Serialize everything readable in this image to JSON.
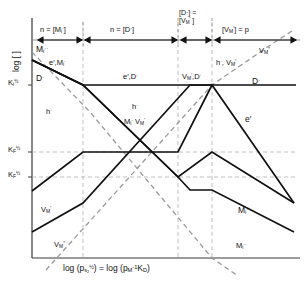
{
  "figure": {
    "kind": "brouwer-defect-diagram",
    "colors": {
      "line": "#111111",
      "dashed": "#9a9a9a",
      "axis": "#3a3a3a",
      "background": "#ffffff"
    }
  },
  "axes": {
    "y_label": "log [ ]",
    "x_label_html": "log (p<sub>s<sub>2</sub></sub><sup>&frac12;</sup>) = log (p<sub>M</sub><sup>-1</sup>K<sub>D</sub>)",
    "y_ticks": [
      {
        "id": "Ki",
        "html": "K<sub>i</sub><sup>&frac12;</sup>",
        "y_frac": 0.29
      },
      {
        "id": "KFp",
        "html": "K<sub>F</sub><sup>&frac12;</sup>",
        "y_frac": 0.545
      },
      {
        "id": "KF",
        "html": "K<sub>F</sub><sup>&frac12;</sup>",
        "y_frac": 0.655
      }
    ]
  },
  "regimes": [
    {
      "id": "regime-1",
      "html": "n = [M<sub>i</sub><sup>&middot;</sup>]",
      "x0": 38,
      "x1": 83
    },
    {
      "id": "regime-2",
      "html": "n = [D<sup>&middot;</sup>]",
      "x0": 85,
      "x1": 178
    },
    {
      "id": "regime-3",
      "html": "[D&middot;] =<br>[V<sub>M</sub><sup>&prime;</sup> ]",
      "x0": 180,
      "x1": 212
    },
    {
      "id": "regime-4",
      "html": "[V<sub>M</sub><sup>&prime;</sup>] = p",
      "x0": 214,
      "x1": 296
    }
  ],
  "curve_labels": [
    {
      "id": "Mi-dd-topleft",
      "html": "M<sub>i</sub><sup>&middot;&middot;</sup>",
      "x": 36,
      "y": 50
    },
    {
      "id": "e-Mi-upperleft",
      "html": "e&prime;,M<sub>i</sub><sup>&middot;</sup>",
      "x": 49,
      "y": 64
    },
    {
      "id": "D-left",
      "html": "D<sup>&middot;</sup>",
      "x": 36,
      "y": 80
    },
    {
      "id": "e-D-center",
      "html": "e&prime;,D<sup>&middot;</sup>",
      "x": 123,
      "y": 79
    },
    {
      "id": "VM-D-right",
      "html": "V<sub>M</sub><sup>&prime;</sup>,D<sup>&middot;</sup>",
      "x": 188,
      "y": 79
    },
    {
      "id": "D-farright",
      "html": "D<sup>&middot;</sup>",
      "x": 252,
      "y": 84
    },
    {
      "id": "h-left",
      "html": "h<sup>&middot;</sup>",
      "x": 46,
      "y": 113
    },
    {
      "id": "h-center",
      "html": "h<sup>&middot;</sup>",
      "x": 132,
      "y": 108
    },
    {
      "id": "Mi-VM-center",
      "html": "M<sub>i</sub><sup>&middot;</sup> V<sub>M</sub><sup>&prime;</sup>",
      "x": 126,
      "y": 123
    },
    {
      "id": "h-VM-right",
      "html": "h<sup>&middot;</sup>, V<sub>M</sub><sup>&prime;</sup>",
      "x": 219,
      "y": 64
    },
    {
      "id": "VM-dd-topright",
      "html": "V<sub>M</sub><sup>&prime;&prime;</sup>",
      "x": 262,
      "y": 52
    },
    {
      "id": "e-right",
      "html": "e&prime;",
      "x": 245,
      "y": 120
    },
    {
      "id": "VM-bottomleft",
      "html": "V<sub>M</sub><sup>&prime;</sup>",
      "x": 42,
      "y": 212
    },
    {
      "id": "VM-dd-bottomleft",
      "html": "V<sub>M</sub><sup>&prime;&prime;</sup>",
      "x": 55,
      "y": 246
    },
    {
      "id": "Mi-bottomright",
      "html": "M<sub>i</sub><sup>&middot;</sup>",
      "x": 238,
      "y": 212
    },
    {
      "id": "Mi-dd-bottomright",
      "html": "M<sub>i</sub><sup>&middot;&middot;</sup>",
      "x": 237,
      "y": 248
    }
  ],
  "chart_data": {
    "type": "line",
    "title": "",
    "xlabel": "log (p_s2^1/2) = log (p_M^-1 K_D)",
    "ylabel": "log [ ]",
    "grid": true,
    "legend": "inline-curve-labels",
    "plot_box": {
      "x0": 32,
      "y0": 38,
      "x1": 296,
      "y1": 258
    },
    "breakpoints_x": [
      83,
      178,
      212
    ],
    "gridlines_y": [
      85,
      152,
      177
    ],
    "series": [
      {
        "name": "D-dot",
        "style": "solid",
        "points": [
          [
            32,
            60
          ],
          [
            83,
            85
          ],
          [
            296,
            85
          ]
        ]
      },
      {
        "name": "e-prime",
        "style": "solid",
        "points": [
          [
            32,
            60
          ],
          [
            83,
            85
          ],
          [
            178,
            177
          ],
          [
            212,
            152
          ],
          [
            296,
            203
          ]
        ]
      },
      {
        "name": "h-dot",
        "style": "solid",
        "points": [
          [
            32,
            191
          ],
          [
            83,
            152
          ],
          [
            178,
            152
          ],
          [
            212,
            85
          ],
          [
            296,
            203
          ]
        ]
      },
      {
        "name": "V-M-prime",
        "style": "solid",
        "points": [
          [
            32,
            232
          ],
          [
            83,
            203
          ],
          [
            178,
            112
          ],
          [
            190,
            85
          ],
          [
            212,
            85
          ],
          [
            296,
            85
          ]
        ]
      },
      {
        "name": "M-i-dot",
        "style": "solid",
        "points": [
          [
            32,
            60
          ],
          [
            83,
            85
          ],
          [
            178,
            177
          ],
          [
            190,
            190
          ],
          [
            212,
            190
          ],
          [
            296,
            232
          ]
        ]
      },
      {
        "name": "M-i-dotdot",
        "style": "dashed",
        "points": [
          [
            32,
            52
          ],
          [
            90,
            112
          ],
          [
            212,
            258
          ],
          [
            240,
            275
          ]
        ]
      },
      {
        "name": "V-M-doubleprime",
        "style": "dashed",
        "points": [
          [
            46,
            268
          ],
          [
            212,
            85
          ],
          [
            270,
            44
          ],
          [
            290,
            34
          ]
        ]
      }
    ]
  }
}
